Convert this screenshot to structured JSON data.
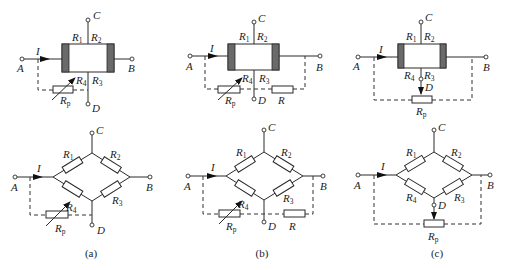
{
  "figure": {
    "panels": [
      {
        "id": "a",
        "caption": "(a)",
        "top": {
          "terminals": [
            "A",
            "B",
            "C",
            "D"
          ],
          "current": "I",
          "resistors": [
            "R1",
            "R2",
            "R3",
            "R4"
          ],
          "balance": "Rp"
        },
        "bottom": {
          "terminals": [
            "A",
            "B",
            "C",
            "D"
          ],
          "current": "I",
          "resistors": [
            "R1",
            "R2",
            "R3",
            "R4"
          ],
          "balance": "Rp"
        }
      },
      {
        "id": "b",
        "caption": "(b)",
        "top": {
          "terminals": [
            "A",
            "B",
            "C",
            "D"
          ],
          "current": "I",
          "resistors": [
            "R1",
            "R2",
            "R3",
            "R4"
          ],
          "balance": "Rp",
          "series": "R"
        },
        "bottom": {
          "terminals": [
            "A",
            "B",
            "C",
            "D"
          ],
          "current": "I",
          "resistors": [
            "R1",
            "R2",
            "R3",
            "R4"
          ],
          "balance": "Rp",
          "series": "R"
        }
      },
      {
        "id": "c",
        "caption": "(c)",
        "top": {
          "terminals": [
            "A",
            "B",
            "C",
            "D"
          ],
          "current": "I",
          "resistors": [
            "R1",
            "R2",
            "R3",
            "R4"
          ],
          "balance": "Rp"
        },
        "bottom": {
          "terminals": [
            "A",
            "B",
            "C",
            "D"
          ],
          "current": "I",
          "resistors": [
            "R1",
            "R2",
            "R3",
            "R4"
          ],
          "balance": "Rp"
        }
      }
    ],
    "labels": {
      "A": "A",
      "B": "B",
      "C": "C",
      "D": "D",
      "I": "I",
      "R": "R",
      "R_main": "R",
      "p": "p",
      "n1": "1",
      "n2": "2",
      "n3": "3",
      "n4": "4"
    }
  }
}
